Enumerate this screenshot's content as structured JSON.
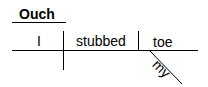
{
  "diagram": {
    "type": "sentence-diagram",
    "interjection": "Ouch",
    "subject": "I",
    "verb": "stubbed",
    "direct_object": "toe",
    "modifier": "my"
  }
}
